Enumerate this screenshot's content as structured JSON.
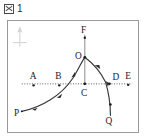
{
  "caption": {
    "box_glyph": "図",
    "box_icon_name": "boxed-zu-icon",
    "number": "1",
    "full_text": "図 1"
  },
  "figure": {
    "north_marker": {
      "icon_name": "north-arrow-icon",
      "label": ""
    },
    "horizon_line": {
      "name": "horizon-dotted-line",
      "style": "dotted",
      "color": "#555555",
      "y": 64
    },
    "vertical_line": {
      "name": "meridian-line-F-C",
      "from": "F",
      "to": "C",
      "color": "#777777"
    },
    "curve": {
      "name": "celestial-path-curve",
      "from": "P",
      "apex": "O",
      "to": "Q",
      "color": "#3a3a3a",
      "arrow_count": 4,
      "direction": "P to O to Q"
    },
    "points": [
      {
        "id": "P",
        "label": "P",
        "x": 14,
        "y": 92,
        "label_x": 8,
        "label_y": 97,
        "has_dot": false
      },
      {
        "id": "A",
        "label": "A",
        "x": 26,
        "y": 64,
        "label_x": 22,
        "label_y": 59,
        "has_dot": true
      },
      {
        "id": "B",
        "label": "B",
        "x": 52,
        "y": 64,
        "label_x": 48,
        "label_y": 59,
        "has_dot": true
      },
      {
        "id": "C",
        "label": "C",
        "x": 78,
        "y": 64,
        "label_x": 74,
        "label_y": 76,
        "has_dot": true
      },
      {
        "id": "D",
        "label": "D",
        "x": 104,
        "y": 64,
        "label_x": 104,
        "label_y": 60,
        "has_dot": true
      },
      {
        "id": "E",
        "label": "E",
        "x": 122,
        "y": 64,
        "label_x": 119,
        "label_y": 59,
        "has_dot": true
      },
      {
        "id": "O",
        "label": "O",
        "x": 78,
        "y": 37,
        "label_x": 70,
        "label_y": 38,
        "has_dot": true
      },
      {
        "id": "F",
        "label": "F",
        "x": 78,
        "y": 14,
        "label_x": 75,
        "label_y": 13,
        "has_dot": true
      },
      {
        "id": "Q",
        "label": "Q",
        "x": 104,
        "y": 96,
        "label_x": 100,
        "label_y": 105,
        "has_dot": false
      }
    ],
    "colors": {
      "frame": "#9a9a9a",
      "curve": "#3a3a3a",
      "dotted": "#555555",
      "text": "#1c1c1c"
    }
  }
}
